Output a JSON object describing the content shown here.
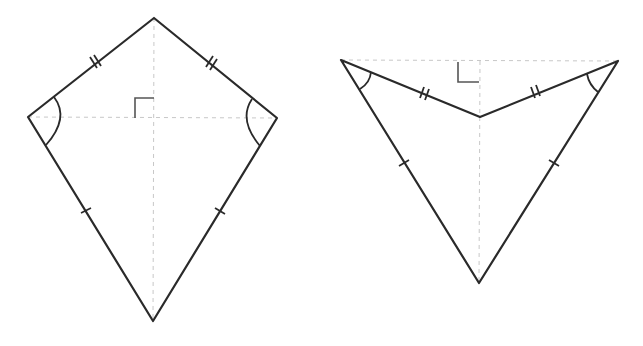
{
  "diagram": {
    "title": "",
    "colors": {
      "edge": "#2a2a2a",
      "diagonal": "#c8c8c8",
      "background": "#ffffff"
    },
    "figures": [
      {
        "name": "kite",
        "vertices": {
          "top": [
            154,
            18
          ],
          "left": [
            28,
            117
          ],
          "right": [
            277,
            118
          ],
          "bottom": [
            153,
            321
          ]
        },
        "marks": {
          "upper_sides": "double-tick (equal)",
          "lower_sides": "single-tick (equal)",
          "side_angles": "arc (equal angles)",
          "diagonals": "dashed, perpendicular (right-angle mark)"
        }
      },
      {
        "name": "dart",
        "vertices": {
          "left": [
            341,
            60
          ],
          "right": [
            618,
            61
          ],
          "inner": [
            480,
            117
          ],
          "bottom": [
            479,
            283
          ]
        },
        "marks": {
          "upper_sides": "double-tick (equal)",
          "lower_sides": "single-tick (equal)",
          "side_angles": "arc (equal angles)",
          "diagonals": "dashed, perpendicular (right-angle mark)"
        }
      }
    ]
  }
}
